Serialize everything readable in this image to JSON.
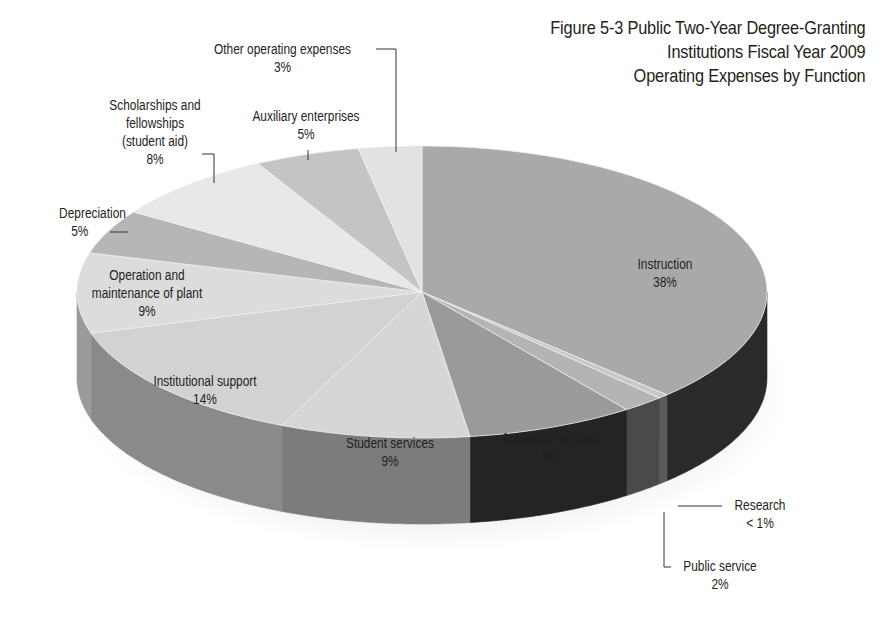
{
  "title": {
    "line1": "Figure 5-3 Public Two-Year Degree-Granting",
    "line2": "Institutions Fiscal Year 2009",
    "line3": "Operating Expenses by Function"
  },
  "labels": {
    "instruction": {
      "name": "Instruction",
      "pct": "38%"
    },
    "research": {
      "name": "Research",
      "pct": "< 1%"
    },
    "public_service": {
      "name": "Public service",
      "pct": "2%"
    },
    "academic_support": {
      "name": "Academic Support",
      "pct": "8%"
    },
    "student_services": {
      "name": "Student services",
      "pct": "9%"
    },
    "institutional_support": {
      "name": "Institutional support",
      "pct": "14%"
    },
    "operation_maintenance": {
      "name1": "Operation and",
      "name2": "maintenance of plant",
      "pct": "9%"
    },
    "depreciation": {
      "name": "Depreciation",
      "pct": "5%"
    },
    "scholarships": {
      "name1": "Scholarships and",
      "name2": "fellowships",
      "name3": "(student aid)",
      "pct": "8%"
    },
    "auxiliary": {
      "name": "Auxiliary enterprises",
      "pct": "5%"
    },
    "other": {
      "name": "Other operating expenses",
      "pct": "3%"
    }
  },
  "chart_data": {
    "type": "pie",
    "style": "3d",
    "title": "Figure 5-3 Public Two-Year Degree-Granting Institutions Fiscal Year 2009 Operating Expenses by Function",
    "categories": [
      "Instruction",
      "Research",
      "Public service",
      "Academic Support",
      "Student services",
      "Institutional support",
      "Operation and maintenance of plant",
      "Depreciation",
      "Scholarships and fellowships (student aid)",
      "Auxiliary enterprises",
      "Other operating expenses"
    ],
    "values": [
      38,
      0.5,
      2,
      8,
      9,
      14,
      9,
      5,
      8,
      5,
      3
    ],
    "value_labels": [
      "38%",
      "< 1%",
      "2%",
      "8%",
      "9%",
      "14%",
      "9%",
      "5%",
      "8%",
      "5%",
      "3%"
    ],
    "top_colors": [
      "#a9a9a9",
      "#c8c8c8",
      "#b4b4b4",
      "#9a9a9a",
      "#d6d6d6",
      "#d2d2d2",
      "#dcdcdc",
      "#b6b6b6",
      "#e8e8e8",
      "#c4c4c4",
      "#e2e2e2"
    ],
    "side_colors": [
      "#2a2a2a",
      "#5a5a5a",
      "#4a4a4a",
      "#242424",
      "#7c7c7c",
      "#8a8a8a",
      "#9a9a9a",
      "#6a6a6a",
      "#a0a0a0",
      "#707070",
      "#909090"
    ],
    "start_angle_deg": 0,
    "direction": "clockwise",
    "legend": "none (callout labels)"
  }
}
